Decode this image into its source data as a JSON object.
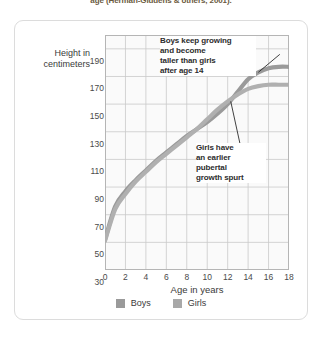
{
  "caption": "age (Herman-Giddens & others, 2001).",
  "axis": {
    "y_title_line1": "Height in",
    "y_title_line2": "centimeters",
    "x_title": "Age in years"
  },
  "annotations": {
    "boys": [
      "Boys keep growing",
      "and become",
      "taller than girls",
      "after age 14"
    ],
    "girls": [
      "Girls have",
      "an earlier",
      "pubertal",
      "growth spurt"
    ]
  },
  "legend": [
    {
      "label": "Boys",
      "color": "#9a9a9a"
    },
    {
      "label": "Girls",
      "color": "#a8a8a8"
    }
  ],
  "colors": {
    "boys_line": "#9a9a9a",
    "girls_line": "#b0b0b0",
    "grid": "#c9c9c9",
    "plot_bg": "#fafafa",
    "card_border": "#dcdcdc",
    "caption": "#6b5a3e",
    "leader": "#2d2d2d"
  },
  "chart_data": {
    "type": "line",
    "title": "",
    "xlabel": "Age in years",
    "ylabel": "Height in centimeters",
    "xlim": [
      0,
      18
    ],
    "ylim": [
      30,
      200
    ],
    "xticks": [
      0,
      2,
      4,
      6,
      8,
      10,
      12,
      14,
      16,
      18
    ],
    "yticks": [
      30,
      50,
      70,
      90,
      110,
      130,
      150,
      170,
      190
    ],
    "grid": true,
    "legend_position": "bottom",
    "x": [
      0,
      1,
      2,
      3,
      4,
      5,
      6,
      7,
      8,
      9,
      10,
      11,
      12,
      13,
      14,
      15,
      16,
      17,
      18
    ],
    "series": [
      {
        "name": "Boys",
        "values": [
          52,
          76,
          87,
          95,
          102,
          109,
          115,
          121,
          127,
          132,
          137,
          143,
          150,
          159,
          168,
          173,
          176,
          177,
          177
        ]
      },
      {
        "name": "Girls",
        "values": [
          51,
          74,
          85,
          94,
          101,
          108,
          114,
          120,
          126,
          132,
          139,
          146,
          152,
          157,
          161,
          163,
          164,
          164,
          164
        ]
      }
    ],
    "annotations": [
      {
        "text": "Boys keep growing and become taller than girls after age 14",
        "points_to": {
          "x": 15.0,
          "y": 173
        }
      },
      {
        "text": "Girls have an earlier pubertal growth spurt",
        "points_to": {
          "x": 12.3,
          "y": 152
        }
      }
    ]
  }
}
